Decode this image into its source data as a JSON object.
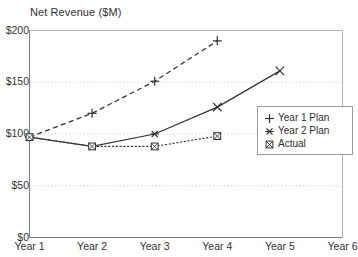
{
  "chart": {
    "title": "Net Revenue ($M)",
    "y_axis": {
      "ticks": [
        "$0",
        "$50",
        "$100",
        "$150",
        "$200"
      ],
      "values": [
        0,
        50,
        100,
        150,
        200
      ]
    },
    "x_axis": {
      "ticks": [
        "Year 1",
        "Year 2",
        "Year 3",
        "Year 4",
        "Year 5",
        "Year 6"
      ]
    },
    "legend": {
      "entries": [
        {
          "label": "Year 1 Plan",
          "marker": "plus-marker"
        },
        {
          "label": "Year 2 Plan",
          "marker": "asterisk-marker"
        },
        {
          "label": "Actual",
          "marker": "boxed-x-marker"
        }
      ]
    }
  },
  "chart_data": {
    "type": "line",
    "title": "Net Revenue ($M)",
    "xlabel": "",
    "ylabel": "",
    "categories": [
      "Year 1",
      "Year 2",
      "Year 3",
      "Year 4",
      "Year 5",
      "Year 6"
    ],
    "ylim": [
      0,
      200
    ],
    "yticks": [
      0,
      50,
      100,
      150,
      200
    ],
    "ytick_labels": [
      "$0",
      "$50",
      "$100",
      "$150",
      "$200"
    ],
    "grid": "horizontal-dotted",
    "legend_position": "right-middle",
    "series": [
      {
        "name": "Year 1 Plan",
        "marker": "plus",
        "line_style": "dashed",
        "color": "#333333",
        "x": [
          "Year 1",
          "Year 2",
          "Year 3",
          "Year 4"
        ],
        "values": [
          97,
          120,
          151,
          190
        ]
      },
      {
        "name": "Year 2 Plan",
        "marker": "asterisk",
        "line_style": "solid",
        "color": "#333333",
        "x": [
          "Year 1",
          "Year 2",
          "Year 3",
          "Year 4",
          "Year 5"
        ],
        "values": [
          97,
          88,
          100,
          126,
          161
        ]
      },
      {
        "name": "Actual",
        "marker": "boxed-x",
        "line_style": "dotted",
        "color": "#333333",
        "x": [
          "Year 1",
          "Year 2",
          "Year 3",
          "Year 4"
        ],
        "values": [
          97,
          88,
          88,
          98
        ]
      }
    ]
  }
}
